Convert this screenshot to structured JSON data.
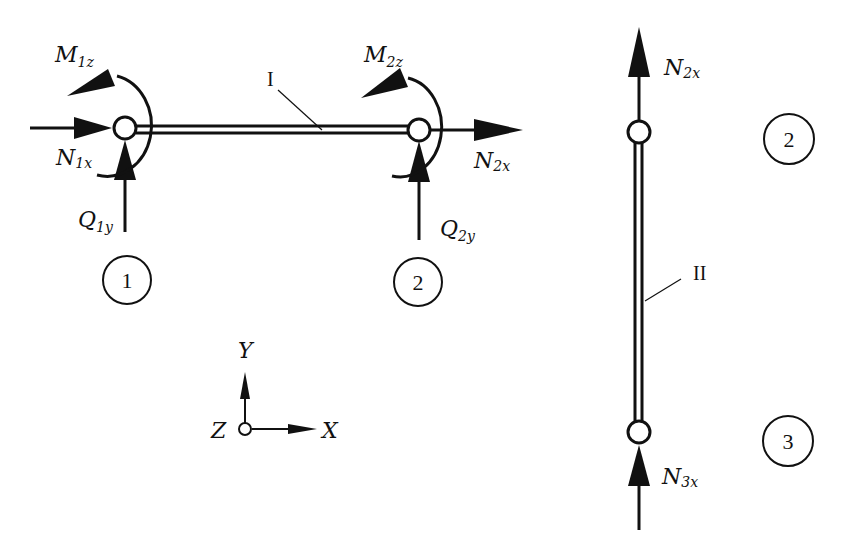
{
  "diagram": {
    "type": "free-body diagram of frame elements",
    "colors": {
      "ink": "#111111",
      "background": "#ffffff"
    },
    "element_I": {
      "label": "I",
      "left_node": {
        "id": "1",
        "forces": {
          "axial": {
            "main": "N",
            "sub": "1x"
          },
          "shear": {
            "main": "Q",
            "sub": "1y"
          },
          "moment": {
            "main": "M",
            "sub": "1z"
          }
        }
      },
      "right_node": {
        "id": "2",
        "forces": {
          "axial": {
            "main": "N",
            "sub": "2x"
          },
          "shear": {
            "main": "Q",
            "sub": "2y"
          },
          "moment": {
            "main": "M",
            "sub": "2z"
          }
        }
      }
    },
    "element_II": {
      "label": "II",
      "top_node": {
        "id": "2",
        "forces": {
          "axial": {
            "main": "N",
            "sub": "2x"
          }
        }
      },
      "bottom_node": {
        "id": "3",
        "forces": {
          "axial": {
            "main": "N",
            "sub": "3x"
          }
        }
      }
    },
    "node_markers": [
      "1",
      "2",
      "2",
      "3"
    ],
    "axes": {
      "x": "X",
      "y": "Y",
      "z": "Z"
    }
  }
}
